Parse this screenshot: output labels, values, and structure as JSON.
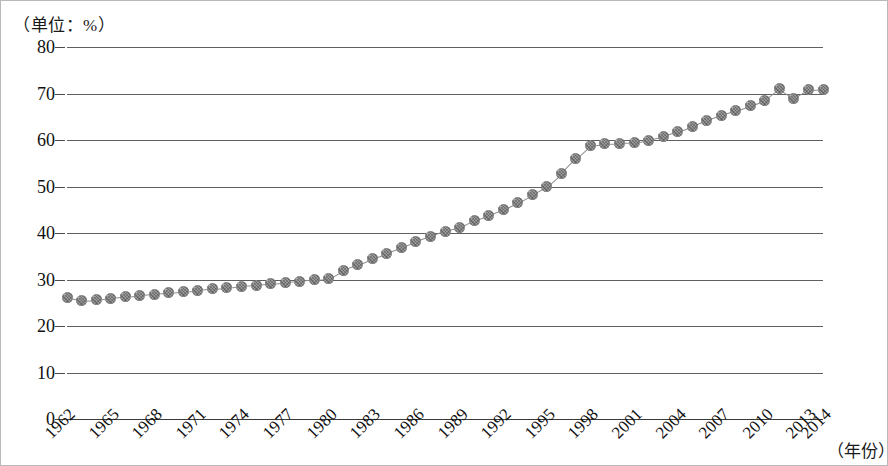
{
  "unit_caption": "（单位：%）",
  "xaxis_title": "（年份）",
  "chart_data": {
    "type": "line",
    "title": "",
    "subtitle": "",
    "xlabel": "（年份）",
    "ylabel": "（单位：%）",
    "grid": true,
    "legend": false,
    "legend_position": "none",
    "marker": "filled-textured-circle",
    "marker_color": "#9a9a9a",
    "line_color": "#8f8f8f",
    "xlim": [
      1962,
      2014
    ],
    "ylim": [
      0,
      80
    ],
    "ytick_labels": [
      "80",
      "70",
      "60",
      "50",
      "40",
      "30",
      "20",
      "10",
      "0"
    ],
    "yticks": [
      80,
      70,
      60,
      50,
      40,
      30,
      20,
      10,
      0
    ],
    "xtick_labels": [
      "1962",
      "1965",
      "1968",
      "1971",
      "1974",
      "1977",
      "1980",
      "1983",
      "1986",
      "1989",
      "1992",
      "1995",
      "1998",
      "2001",
      "2004",
      "2007",
      "2010",
      "2013",
      "2014"
    ],
    "xticks": [
      1962,
      1965,
      1968,
      1971,
      1974,
      1977,
      1980,
      1983,
      1986,
      1989,
      1992,
      1995,
      1998,
      2001,
      2004,
      2007,
      2010,
      2013,
      2014
    ],
    "x": [
      1962,
      1963,
      1964,
      1965,
      1966,
      1967,
      1968,
      1969,
      1970,
      1971,
      1972,
      1973,
      1974,
      1975,
      1976,
      1977,
      1978,
      1979,
      1980,
      1981,
      1982,
      1983,
      1984,
      1985,
      1986,
      1987,
      1988,
      1989,
      1990,
      1991,
      1992,
      1993,
      1994,
      1995,
      1996,
      1997,
      1998,
      1999,
      2000,
      2001,
      2002,
      2003,
      2004,
      2005,
      2006,
      2007,
      2008,
      2009,
      2010,
      2011,
      2012,
      2013,
      2014
    ],
    "values": [
      26.2,
      25.4,
      25.6,
      26.0,
      26.3,
      26.6,
      26.8,
      27.1,
      27.4,
      27.7,
      28.0,
      28.2,
      28.6,
      28.8,
      29.1,
      29.4,
      29.6,
      30.0,
      30.2,
      32.0,
      33.2,
      34.5,
      35.6,
      36.8,
      38.2,
      39.3,
      40.4,
      41.2,
      42.6,
      43.8,
      45.0,
      46.5,
      48.2,
      50.0,
      52.8,
      56.0,
      58.8,
      59.2,
      59.3,
      59.4,
      60.0,
      60.8,
      61.8,
      63.0,
      64.2,
      65.3,
      66.3,
      67.4,
      68.5,
      71.0,
      69.0,
      70.8,
      70.9
    ],
    "series": [
      {
        "name": "数值",
        "values": [
          26.2,
          25.4,
          25.6,
          26.0,
          26.3,
          26.6,
          26.8,
          27.1,
          27.4,
          27.7,
          28.0,
          28.2,
          28.6,
          28.8,
          29.1,
          29.4,
          29.6,
          30.0,
          30.2,
          32.0,
          33.2,
          34.5,
          35.6,
          36.8,
          38.2,
          39.3,
          40.4,
          41.2,
          42.6,
          43.8,
          45.0,
          46.5,
          48.2,
          50.0,
          52.8,
          56.0,
          58.8,
          59.2,
          59.3,
          59.4,
          60.0,
          60.8,
          61.8,
          63.0,
          64.2,
          65.3,
          66.3,
          67.4,
          68.5,
          71.0,
          69.0,
          70.8,
          70.9
        ]
      }
    ]
  }
}
